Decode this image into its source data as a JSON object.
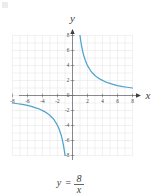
{
  "figure": {
    "equation_label": {
      "lhs": "y",
      "equals": "=",
      "numerator": "8",
      "denominator": "x"
    },
    "axis_names": {
      "x": "x",
      "y": "y"
    }
  },
  "chart_data": {
    "type": "line",
    "title": "",
    "subtitle": "",
    "xlabel": "x",
    "ylabel": "y",
    "annotation": "y = 8/x",
    "function": "y = 8/x",
    "grid": true,
    "legend_position": "none",
    "xlim": [
      -8,
      8
    ],
    "ylim": [
      -8,
      8
    ],
    "xticks": [
      -8,
      -6,
      -4,
      -2,
      0,
      2,
      4,
      6,
      8
    ],
    "yticks": [
      -8,
      -6,
      -4,
      -2,
      0,
      2,
      4,
      6,
      8
    ],
    "xtick_labels": [
      "-8",
      "-6",
      "-4",
      "-2",
      "0",
      "2",
      "4",
      "6",
      "8"
    ],
    "ytick_labels": [
      "-8",
      "-6",
      "-4",
      "-2",
      "0",
      "2",
      "4",
      "6",
      "8"
    ],
    "grid_step": 1,
    "series": [
      {
        "name": "y = 8/x (right branch)",
        "color": "#4ea3cc",
        "x": [
          1.0,
          1.1,
          1.2,
          1.35,
          1.5,
          1.7,
          1.9,
          2.1,
          2.4,
          2.7,
          3.0,
          3.4,
          3.8,
          4.3,
          4.8,
          5.4,
          6.0,
          6.7,
          7.3,
          8.0
        ],
        "values": [
          8.0,
          7.27,
          6.67,
          5.93,
          5.33,
          4.71,
          4.21,
          3.81,
          3.33,
          2.96,
          2.67,
          2.35,
          2.11,
          1.86,
          1.67,
          1.48,
          1.33,
          1.19,
          1.1,
          1.0
        ]
      },
      {
        "name": "y = 8/x (left branch)",
        "color": "#4ea3cc",
        "x": [
          -8.0,
          -7.3,
          -6.7,
          -6.0,
          -5.4,
          -4.8,
          -4.3,
          -3.8,
          -3.4,
          -3.0,
          -2.7,
          -2.4,
          -2.1,
          -1.9,
          -1.7,
          -1.5,
          -1.35,
          -1.2,
          -1.1,
          -1.0
        ],
        "values": [
          -1.0,
          -1.1,
          -1.19,
          -1.33,
          -1.48,
          -1.67,
          -1.86,
          -2.11,
          -2.35,
          -2.67,
          -2.96,
          -3.33,
          -3.81,
          -4.21,
          -4.71,
          -5.33,
          -5.93,
          -6.67,
          -7.27,
          -8.0
        ]
      }
    ],
    "colors": {
      "curve": "#4ea3cc",
      "grid": "#dfdfe3",
      "axis": "#7a7a80",
      "text": "#3d3d42",
      "background": "#ffffff"
    }
  }
}
